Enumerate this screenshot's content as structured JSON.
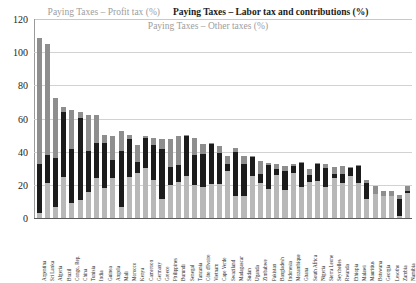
{
  "legend": {
    "profit": "Paying Taxes – Profit tax (%)",
    "labor": "Paying Taxes – Labor tax and contributions (%)",
    "other": "Paying Taxes – Other taxes (%)"
  },
  "axis": {
    "y_ticks": [
      "0",
      "20",
      "40",
      "60",
      "80",
      "100",
      "120"
    ],
    "y_min": 0,
    "y_max": 120
  },
  "chart_data": {
    "type": "bar",
    "stacked": true,
    "title": "",
    "xlabel": "",
    "ylabel": "",
    "ylim": [
      0,
      120
    ],
    "grid": true,
    "legend_position": "top",
    "colors": {
      "profit": "#b8b8b8",
      "labor": "#1c1c1c",
      "other": "#8e8e8e"
    },
    "categories": [
      "Argentina",
      "Sri Lanka",
      "Algeria",
      "Brazil",
      "Congo, Rep.",
      "China",
      "Tunisia",
      "India",
      "Guinea",
      "Angola",
      "Mali",
      "Morocco",
      "Kenya",
      "Cameroon",
      "Germany",
      "Greece",
      "Philippines",
      "Burundi",
      "Senegal",
      "Tanzania",
      "Côte d'Ivoire",
      "Vietnam",
      "Cape Verde",
      "Swaziland",
      "Madagascar",
      "Sudan",
      "Uganda",
      "Zimbabwe",
      "Pakistan",
      "Bangladesh",
      "Indonesia",
      "Mozambique",
      "Ghana",
      "South Africa",
      "Nigeria",
      "Sierra Leone",
      "Seychelles",
      "Rwanda",
      "Ethiopia",
      "Malawi",
      "Mauritius",
      "Botswana",
      "Georgia",
      "Lesotho",
      "Zambia",
      "Namibia"
    ],
    "series": [
      {
        "name": "Paying Taxes – Profit tax (%)",
        "values": [
          3.0,
          21.0,
          6.6,
          24.5,
          9.0,
          10.8,
          15.4,
          24.4,
          18.0,
          24.2,
          6.7,
          24.8,
          27.0,
          30.1,
          23.0,
          11.2,
          20.0,
          22.0,
          25.3,
          20.0,
          18.6,
          20.7,
          20.6,
          28.4,
          13.2,
          13.5,
          25.4,
          21.1,
          17.2,
          25.7,
          17.1,
          27.2,
          18.6,
          21.7,
          22.1,
          18.9,
          24.0,
          21.0,
          25.4,
          21.3,
          11.2,
          14.5,
          13.3,
          13.2,
          1.3,
          15.2
        ]
      },
      {
        "name": "Paying Taxes – Labor tax and contributions (%)",
        "values": [
          29.4,
          16.9,
          29.7,
          39.6,
          32.5,
          49.4,
          25.2,
          20.7,
          27.0,
          10.8,
          34.0,
          22.6,
          6.8,
          18.3,
          21.2,
          30.7,
          10.8,
          10.2,
          24.1,
          18.0,
          20.2,
          24.5,
          18.5,
          4.0,
          26.5,
          19.0,
          11.2,
          5.4,
          14.6,
          3.9,
          11.5,
          4.4,
          14.7,
          4.1,
          10.8,
          11.3,
          2.7,
          5.6,
          5.1,
          10.0,
          9.8,
          0.0,
          0.0,
          0.0,
          10.4,
          1.0
        ]
      },
      {
        "name": "Paying Taxes – Other taxes (%)",
        "values": [
          76.1,
          67.0,
          35.8,
          3.0,
          23.6,
          3.7,
          21.4,
          16.8,
          4.9,
          14.3,
          11.8,
          2.8,
          10.2,
          0.8,
          3.9,
          5.8,
          16.6,
          17.4,
          0.7,
          10.5,
          5.8,
          0.3,
          4.2,
          4.8,
          2.8,
          4.7,
          0.8,
          7.6,
          1.3,
          2.7,
          2.5,
          1.0,
          0.7,
          4.0,
          0.4,
          2.5,
          4.0,
          4.5,
          0.4,
          0.6,
          1.9,
          4.6,
          3.0,
          2.8,
          2.0,
          3.4
        ]
      }
    ],
    "totals": [
      108.5,
      104.9,
      72.1,
      67.1,
      65.1,
      63.9,
      62.0,
      61.9,
      49.9,
      49.3,
      52.5,
      50.2,
      44.0,
      49.2,
      48.1,
      47.7,
      47.4,
      49.6,
      50.1,
      48.5,
      44.6,
      45.5,
      43.3,
      37.2,
      42.5,
      37.2,
      37.4,
      34.1,
      33.1,
      32.3,
      31.1,
      32.6,
      34.0,
      29.8,
      33.3,
      32.7,
      30.7,
      31.1,
      30.9,
      31.9,
      22.9,
      19.1,
      16.3,
      16.0,
      13.7,
      19.6
    ]
  }
}
